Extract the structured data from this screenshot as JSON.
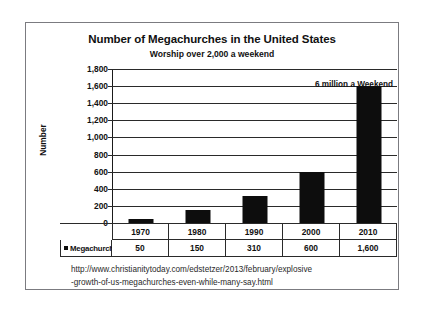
{
  "chart_data": {
    "type": "bar",
    "title": "Number of Megachurches in the United States",
    "subtitle": "Worship over 2,000 a weekend",
    "xlabel": "",
    "ylabel": "Number",
    "categories": [
      "1970",
      "1980",
      "1990",
      "2000",
      "2010"
    ],
    "values": [
      50,
      150,
      310,
      600,
      1600
    ],
    "value_labels": [
      "50",
      "150",
      "310",
      "600",
      "1,600"
    ],
    "series": [
      {
        "name": "Megachurches",
        "values": [
          50,
          150,
          310,
          600,
          1600
        ]
      }
    ],
    "ylim": [
      0,
      1800
    ],
    "ytick_step": 200,
    "ytick_labels": [
      "1,800",
      "1,600",
      "1,400",
      "1,200",
      "1,000",
      "800",
      "600",
      "400",
      "200",
      "0"
    ],
    "ytick_values": [
      1800,
      1600,
      1400,
      1200,
      1000,
      800,
      600,
      400,
      200,
      0
    ],
    "grid": true,
    "legend_position": "table-row",
    "bar_color": "#0d0d0d",
    "annotations": [
      {
        "text": "6 million a Weekend",
        "position": "top-right"
      }
    ]
  },
  "table": {
    "legend_label": "Megachurches",
    "legend_marker": "square-marker",
    "year_headers": [
      "1970",
      "1980",
      "1990",
      "2000",
      "2010"
    ],
    "value_cells": [
      "50",
      "150",
      "310",
      "600",
      "1,600"
    ]
  },
  "source": {
    "line1": "http://www.christianitytoday.com/edstetzer/2013/february/explosive",
    "line2": "-growth-of-us-megachurches-even-while-many-say.html"
  }
}
